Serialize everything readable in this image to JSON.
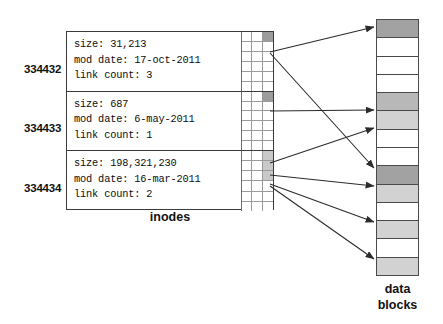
{
  "diagram": {
    "inodes_caption": "inodes",
    "data_caption_line1": "data",
    "data_caption_line2": "blocks",
    "colors": {
      "border": "#3b3b3b",
      "grid_line": "#9a9a9a",
      "block_border": "#4a4a4a",
      "shade_dark": "#a2a2a2",
      "shade_mid": "#b8b8b8",
      "shade_light": "#d2d2d2",
      "pointer_dark": "#9c9c9c",
      "pointer_light": "#c9c9c9",
      "arrow": "#2b2b2b",
      "text": "#0d0d0d",
      "background": "#ffffff"
    }
  },
  "inodes": [
    {
      "number": "334432",
      "size_line": "size: 31,213",
      "mod_date_line": "mod date: 17-oct-2011",
      "link_count_line": "link count: 3",
      "size": "31,213",
      "mod_date": "17-oct-2011",
      "link_count": "3"
    },
    {
      "number": "334433",
      "size_line": "size: 687",
      "mod_date_line": "mod date: 6-may-2011",
      "link_count_line": "link count: 1",
      "size": "687",
      "mod_date": "6-may-2011",
      "link_count": "1"
    },
    {
      "number": "334434",
      "size_line": "size: 198,321,230",
      "mod_date_line": "mod date: 16-mar-2011",
      "link_count_line": "link count: 2",
      "size": "198,321,230",
      "mod_date": "16-mar-2011",
      "link_count": "2"
    }
  ],
  "data_blocks": [
    {
      "index": 1,
      "shade": "dark"
    },
    {
      "index": 2,
      "shade": "none"
    },
    {
      "index": 3,
      "shade": "none"
    },
    {
      "index": 4,
      "shade": "none"
    },
    {
      "index": 5,
      "shade": "mid"
    },
    {
      "index": 6,
      "shade": "light"
    },
    {
      "index": 7,
      "shade": "none"
    },
    {
      "index": 8,
      "shade": "none"
    },
    {
      "index": 9,
      "shade": "dark"
    },
    {
      "index": 10,
      "shade": "light"
    },
    {
      "index": 11,
      "shade": "none"
    },
    {
      "index": 12,
      "shade": "light"
    },
    {
      "index": 13,
      "shade": "none"
    },
    {
      "index": 14,
      "shade": "light"
    }
  ],
  "pointer_cells": {
    "rows": 6,
    "cols": 3,
    "inode1_filled": [
      "dark"
    ],
    "inode2_filled": [
      "dark"
    ],
    "inode3_filled": [
      "light",
      "light",
      "light"
    ]
  },
  "arrows": [
    {
      "from_inode": "334432",
      "to_block": 1
    },
    {
      "from_inode": "334432",
      "to_block": 9
    },
    {
      "from_inode": "334433",
      "to_block": 5
    },
    {
      "from_inode": "334434",
      "to_block": 6
    },
    {
      "from_inode": "334434",
      "to_block": 10
    },
    {
      "from_inode": "334434",
      "to_block": 12
    },
    {
      "from_inode": "334434",
      "to_block": 14
    }
  ]
}
